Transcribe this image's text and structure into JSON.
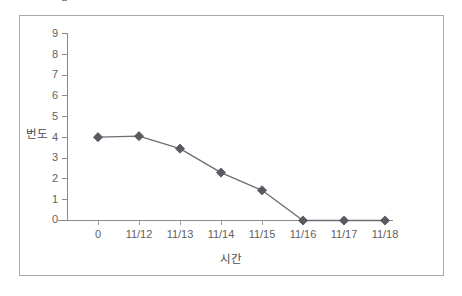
{
  "chart_data": {
    "type": "line",
    "title": "",
    "subtitle": "",
    "xlabel": "시간",
    "ylabel": "번도",
    "categories": [
      "0",
      "11/12",
      "11/13",
      "11/14",
      "11/15",
      "11/16",
      "11/17",
      "11/18"
    ],
    "values": [
      4.0,
      4.05,
      3.45,
      2.3,
      1.45,
      0,
      0,
      0
    ],
    "series": [
      {
        "name": "번도",
        "values": [
          4.0,
          4.05,
          3.45,
          2.3,
          1.45,
          0,
          0,
          0
        ]
      }
    ],
    "ylim": [
      0,
      9
    ],
    "yticks": [
      0,
      1,
      2,
      3,
      4,
      5,
      6,
      7,
      8,
      9
    ],
    "ytick_labels": [
      "0",
      "1",
      "2",
      "3",
      "4",
      "5",
      "6",
      "7",
      "8",
      "9"
    ],
    "xtick_labels": [
      "0",
      "11/12",
      "11/13",
      "11/14",
      "11/15",
      "11/16",
      "11/17",
      "11/18"
    ],
    "grid": false,
    "legend": false,
    "legend_position": "none",
    "marker": "diamond",
    "annotations": []
  },
  "style": {
    "series_color": "#595960",
    "line_color": "#6e6e75",
    "axis_color": "#8a8a8f",
    "tick_label_color": "#5f5f63",
    "axis_title_color": "#4a4a4e",
    "frame_color": "#a9a9ad",
    "background": "#ffffff"
  }
}
